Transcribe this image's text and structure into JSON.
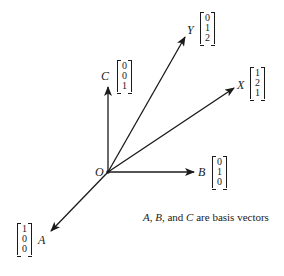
{
  "diagram": {
    "origin": {
      "label": "O"
    },
    "vectors": [
      {
        "name": "A",
        "label": "A",
        "components": [
          "1",
          "0",
          "0"
        ],
        "basis": true
      },
      {
        "name": "B",
        "label": "B",
        "components": [
          "0",
          "1",
          "0"
        ],
        "basis": true
      },
      {
        "name": "C",
        "label": "C",
        "components": [
          "0",
          "0",
          "1"
        ],
        "basis": true
      },
      {
        "name": "X",
        "label": "X",
        "components": [
          "1",
          "2",
          "1"
        ],
        "basis": false
      },
      {
        "name": "Y",
        "label": "Y",
        "components": [
          "0",
          "1",
          "2"
        ],
        "basis": false
      }
    ],
    "caption": {
      "a": "A",
      "sep1": ", ",
      "b": "B",
      "sep2": ", and ",
      "c": "C",
      "rest": " are basis vectors"
    }
  }
}
